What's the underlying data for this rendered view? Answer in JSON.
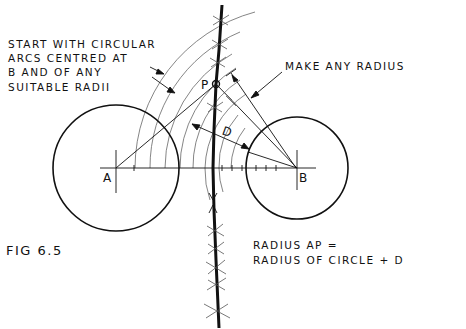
{
  "figure": {
    "caption": "FIG 6.5",
    "points": {
      "A": "A",
      "B": "B",
      "P": "P",
      "D": "D"
    },
    "annotations": {
      "arcs_note": [
        "START WITH CIRCULAR",
        "ARCS CENTRED AT",
        "B AND OF ANY",
        "SUITABLE RADII"
      ],
      "radius_note": "MAKE ANY RADIUS",
      "formula": [
        "RADIUS AP =",
        "RADIUS OF CIRCLE + D"
      ]
    },
    "geometry": {
      "circle_A": {
        "cx": 116,
        "cy": 168,
        "r": 63
      },
      "circle_B": {
        "cx": 297,
        "cy": 168,
        "r": 51
      },
      "point_P": {
        "x": 216,
        "y": 84
      },
      "arc_radii_from_B": [
        162,
        147,
        132,
        117,
        104,
        92,
        78,
        66
      ],
      "colors": {
        "ink": "#111111",
        "construction": "#555555"
      }
    }
  }
}
